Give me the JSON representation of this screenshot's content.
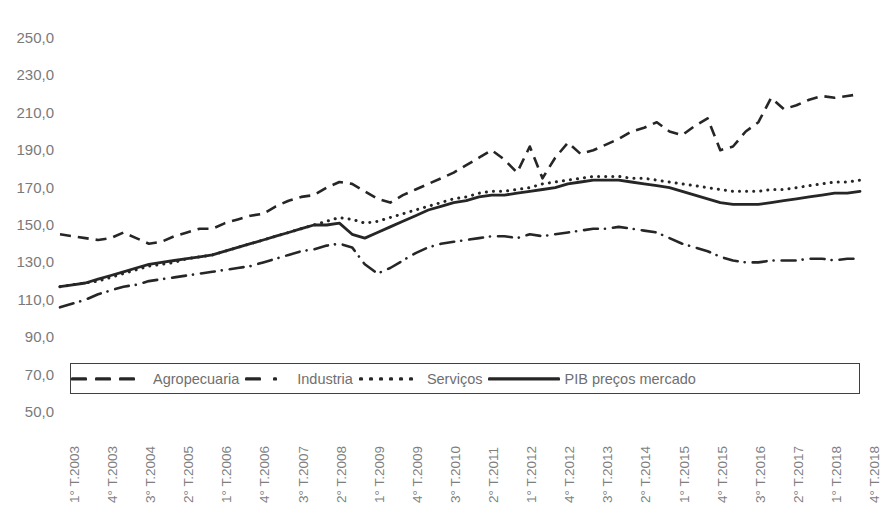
{
  "title": "",
  "legend": {
    "position": "inside-bottom-left",
    "items": [
      {
        "label": "Agropecuaria",
        "style": "dashed",
        "icon": "dashed-line-swatch"
      },
      {
        "label": "Industria",
        "style": "dash-dot",
        "icon": "dash-dot-line-swatch"
      },
      {
        "label": "Serviços",
        "style": "dotted",
        "icon": "dotted-line-swatch"
      },
      {
        "label": "PIB preços mercado",
        "style": "solid",
        "icon": "solid-line-swatch"
      }
    ]
  },
  "y_axis": {
    "ticks": [
      "250,0",
      "230,0",
      "210,0",
      "190,0",
      "170,0",
      "150,0",
      "130,0",
      "110,0",
      "90,0",
      "70,0",
      "50,0"
    ],
    "min": 50,
    "max": 250,
    "step": 20
  },
  "x_axis": {
    "tick_labels": [
      "1° T.2003",
      "4° T.2003",
      "3° T.2004",
      "2° T.2005",
      "1° T.2006",
      "4° T.2006",
      "3° T.2007",
      "2° T.2008",
      "1° T.2009",
      "4° T.2009",
      "3° T.2010",
      "2° T.2011",
      "1° T.2012",
      "4° T.2012",
      "3° T.2013",
      "2° T.2014",
      "1° T.2015",
      "4° T.2015",
      "3° T.2016",
      "2° T.2017",
      "1° T.2018",
      "4° T.2018"
    ],
    "tick_every_n_points": 3,
    "rotation_degrees": -90
  },
  "colors": {
    "line": "#262626",
    "tick_text": "#7a7a7a",
    "legend_text": "#6f6f6f",
    "legend_border": "#404040",
    "background": "#ffffff"
  },
  "chart_data": {
    "type": "line",
    "title": "",
    "xlabel": "",
    "ylabel": "",
    "ylim": [
      50,
      250
    ],
    "grid": false,
    "legend_position": "inside-bottom-left",
    "x": [
      "1° T.2003",
      "2° T.2003",
      "3° T.2003",
      "4° T.2003",
      "1° T.2004",
      "2° T.2004",
      "3° T.2004",
      "4° T.2004",
      "1° T.2005",
      "2° T.2005",
      "3° T.2005",
      "4° T.2005",
      "1° T.2006",
      "2° T.2006",
      "3° T.2006",
      "4° T.2006",
      "1° T.2007",
      "2° T.2007",
      "3° T.2007",
      "4° T.2007",
      "1° T.2008",
      "2° T.2008",
      "3° T.2008",
      "4° T.2008",
      "1° T.2009",
      "2° T.2009",
      "3° T.2009",
      "4° T.2009",
      "1° T.2010",
      "2° T.2010",
      "3° T.2010",
      "4° T.2010",
      "1° T.2011",
      "2° T.2011",
      "3° T.2011",
      "4° T.2011",
      "1° T.2012",
      "2° T.2012",
      "3° T.2012",
      "4° T.2012",
      "1° T.2013",
      "2° T.2013",
      "3° T.2013",
      "4° T.2013",
      "1° T.2014",
      "2° T.2014",
      "3° T.2014",
      "4° T.2014",
      "1° T.2015",
      "2° T.2015",
      "3° T.2015",
      "4° T.2015",
      "1° T.2016",
      "2° T.2016",
      "3° T.2016",
      "4° T.2016",
      "1° T.2017",
      "2° T.2017",
      "3° T.2017",
      "4° T.2017",
      "1° T.2018",
      "2° T.2018",
      "3° T.2018",
      "4° T.2018"
    ],
    "series": [
      {
        "name": "Agropecuaria",
        "style": "dashed",
        "values": [
          145,
          144,
          143,
          142,
          143,
          146,
          143,
          140,
          141,
          144,
          146,
          148,
          148,
          151,
          153,
          155,
          156,
          160,
          163,
          165,
          166,
          170,
          173,
          172,
          168,
          164,
          162,
          166,
          169,
          172,
          175,
          178,
          182,
          186,
          190,
          185,
          178,
          192,
          175,
          186,
          194,
          188,
          190,
          193,
          196,
          200,
          202,
          205,
          200,
          198,
          203,
          207,
          190,
          192,
          200,
          205,
          218,
          212,
          214,
          217,
          219,
          218,
          219,
          220
        ]
      },
      {
        "name": "Industria",
        "style": "dash-dot",
        "values": [
          106,
          108,
          110,
          113,
          115,
          117,
          118,
          120,
          121,
          122,
          123,
          124,
          125,
          126,
          127,
          128,
          130,
          132,
          134,
          136,
          137,
          139,
          140,
          138,
          129,
          124,
          127,
          131,
          135,
          138,
          140,
          141,
          142,
          143,
          144,
          144,
          143,
          145,
          144,
          145,
          146,
          147,
          148,
          148,
          149,
          148,
          147,
          146,
          143,
          140,
          138,
          136,
          133,
          131,
          130,
          130,
          131,
          131,
          131,
          132,
          132,
          131,
          132,
          132
        ]
      },
      {
        "name": "Serviços",
        "style": "dotted",
        "values": [
          117,
          118,
          119,
          120,
          122,
          124,
          126,
          128,
          129,
          130,
          132,
          133,
          134,
          136,
          138,
          140,
          142,
          144,
          146,
          148,
          150,
          152,
          154,
          153,
          151,
          152,
          154,
          156,
          158,
          160,
          162,
          164,
          165,
          167,
          168,
          168,
          169,
          170,
          172,
          173,
          174,
          175,
          176,
          176,
          176,
          175,
          175,
          174,
          173,
          172,
          171,
          170,
          169,
          168,
          168,
          168,
          169,
          169,
          170,
          171,
          172,
          173,
          173,
          174
        ]
      },
      {
        "name": "PIB preços mercado",
        "style": "solid",
        "values": [
          117,
          118,
          119,
          121,
          123,
          125,
          127,
          129,
          130,
          131,
          132,
          133,
          134,
          136,
          138,
          140,
          142,
          144,
          146,
          148,
          150,
          150,
          151,
          145,
          143,
          146,
          149,
          152,
          155,
          158,
          160,
          162,
          163,
          165,
          166,
          166,
          167,
          168,
          169,
          170,
          172,
          173,
          174,
          174,
          174,
          173,
          172,
          171,
          170,
          168,
          166,
          164,
          162,
          161,
          161,
          161,
          162,
          163,
          164,
          165,
          166,
          167,
          167,
          168
        ]
      }
    ]
  }
}
